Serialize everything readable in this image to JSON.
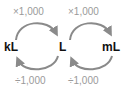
{
  "units": {
    "left": "kL",
    "middle": "L",
    "right": "mL"
  },
  "operations": {
    "top_left": "×1,000",
    "top_right": "×1,000",
    "bottom_left": "÷1,000",
    "bottom_right": "÷1,000"
  },
  "colors": {
    "arrow": "#8a8a8a",
    "op_text": "#9a9a9a",
    "unit_text": "#111111"
  }
}
